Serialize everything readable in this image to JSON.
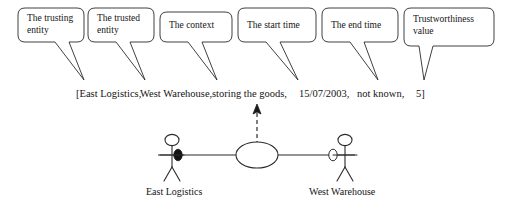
{
  "figure": {
    "stroke_color": "#1a1a1a",
    "fill_color": "#ffffff",
    "background": "#ffffff"
  },
  "callouts": [
    {
      "id": "trusting-entity",
      "label": "The trusting\nentity",
      "box": {
        "x": 18,
        "y": 8,
        "w": 66,
        "h": 34
      },
      "tail": {
        "top_left_x": 55,
        "top_right_x": 69,
        "tip_x": 84,
        "tip_y": 80
      }
    },
    {
      "id": "trusted-entity",
      "label": "The trusted\nentity",
      "box": {
        "x": 88,
        "y": 8,
        "w": 66,
        "h": 34
      },
      "tail": {
        "top_left_x": 116,
        "top_right_x": 130,
        "tip_x": 145,
        "tip_y": 80
      }
    },
    {
      "id": "context",
      "label": "The context",
      "box": {
        "x": 160,
        "y": 12,
        "w": 72,
        "h": 30
      },
      "tail": {
        "top_left_x": 188,
        "top_right_x": 202,
        "tip_x": 217,
        "tip_y": 80
      }
    },
    {
      "id": "start-time",
      "label": "The start time",
      "box": {
        "x": 238,
        "y": 8,
        "w": 78,
        "h": 34
      },
      "tail": {
        "top_left_x": 266,
        "top_right_x": 280,
        "tip_x": 298,
        "tip_y": 80
      }
    },
    {
      "id": "end-time",
      "label": "The end time",
      "box": {
        "x": 322,
        "y": 8,
        "w": 76,
        "h": 34
      },
      "tail": {
        "top_left_x": 350,
        "top_right_x": 364,
        "tip_x": 378,
        "tip_y": 80
      }
    },
    {
      "id": "trustworthiness-value",
      "label": "Trustworthiness\nvalue",
      "box": {
        "x": 404,
        "y": 8,
        "w": 90,
        "h": 38
      },
      "tail": {
        "top_left_x": 419,
        "top_right_x": 433,
        "tip_x": 424,
        "tip_y": 80
      }
    }
  ],
  "tuple": {
    "open_bracket": "[",
    "close_bracket": "]",
    "separator": ",",
    "items": [
      {
        "id": "trusting-entity-value",
        "text": "[East Logistics,",
        "x": 76
      },
      {
        "id": "trusted-entity-value",
        "text": "West Warehouse,",
        "x": 140
      },
      {
        "id": "context-value",
        "text": "storing the goods,",
        "x": 212
      },
      {
        "id": "start-time-value",
        "text": "15/07/2003,",
        "x": 299
      },
      {
        "id": "end-time-value",
        "text": "not known,",
        "x": 357
      },
      {
        "id": "trustworthiness-value-value",
        "text": "5]",
        "x": 416
      }
    ]
  },
  "diagram": {
    "association_line": {
      "x1": 158,
      "x2": 355,
      "y": 155
    },
    "dashed_arrow": {
      "x": 257,
      "y_from": 148,
      "y_to": 107,
      "head": "up"
    },
    "use_case_ellipse": {
      "cx": 257,
      "cy": 155,
      "rx": 21,
      "ry": 13
    },
    "trusting_marker": {
      "cx": 178,
      "cy": 155,
      "rx": 4.5,
      "ry": 6,
      "filled": true
    },
    "trusted_marker": {
      "cx": 333,
      "cy": 155,
      "rx": 4.5,
      "ry": 6,
      "filled": false
    },
    "actors": [
      {
        "id": "east-logistics",
        "label": "East Logistics",
        "head_cx": 172,
        "head_cy": 140,
        "head_rx": 7,
        "head_ry": 6,
        "label_x": 146,
        "label_y": 188
      },
      {
        "id": "west-warehouse",
        "label": "West Warehouse",
        "head_cx": 345,
        "head_cy": 140,
        "head_rx": 7,
        "head_ry": 6,
        "label_x": 310,
        "label_y": 188
      }
    ]
  }
}
